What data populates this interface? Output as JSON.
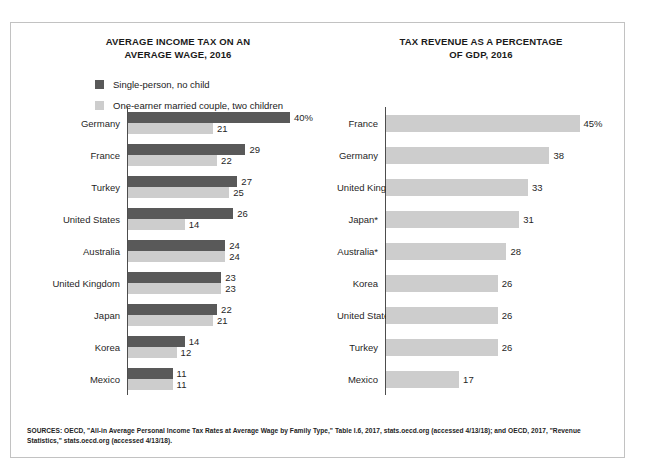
{
  "chart_data": [
    {
      "type": "bar",
      "orientation": "horizontal",
      "title": "AVERAGE INCOME TAX ON AN AVERAGE WAGE, 2016",
      "title_lines": [
        "AVERAGE INCOME TAX ON AN",
        "AVERAGE WAGE, 2016"
      ],
      "xlabel": "",
      "ylabel": "",
      "xlim": [
        0,
        40
      ],
      "grid": false,
      "legend_position": "top-left",
      "categories": [
        "Germany",
        "France",
        "Turkey",
        "United States",
        "Australia",
        "United Kingdom",
        "Japan",
        "Korea",
        "Mexico"
      ],
      "series": [
        {
          "name": "Single-person, no child",
          "color": "#595959",
          "values": [
            40,
            29,
            27,
            26,
            24,
            23,
            22,
            14,
            11
          ],
          "labels": [
            "40%",
            "29",
            "27",
            "26",
            "24",
            "23",
            "22",
            "14",
            "11"
          ]
        },
        {
          "name": "One-earner married couple, two children",
          "color": "#cdcdcd",
          "values": [
            21,
            22,
            25,
            14,
            24,
            23,
            21,
            12,
            11
          ],
          "labels": [
            "21",
            "22",
            "25",
            "14",
            "24",
            "23",
            "21",
            "12",
            "11"
          ]
        }
      ]
    },
    {
      "type": "bar",
      "orientation": "horizontal",
      "title": "TAX REVENUE AS A PERCENTAGE OF GDP, 2016",
      "title_lines": [
        "TAX REVENUE AS A PERCENTAGE",
        "OF GDP, 2016"
      ],
      "xlabel": "",
      "ylabel": "",
      "xlim": [
        0,
        45
      ],
      "grid": false,
      "legend_position": "none",
      "categories": [
        "France",
        "Germany",
        "United Kingdom",
        "Japan*",
        "Australia*",
        "Korea",
        "United States",
        "Turkey",
        "Mexico"
      ],
      "series": [
        {
          "name": "Tax revenue as a percentage of GDP",
          "color": "#cdcdcd",
          "values": [
            45,
            38,
            33,
            31,
            28,
            26,
            26,
            26,
            17
          ],
          "labels": [
            "45%",
            "38",
            "33",
            "31",
            "28",
            "26",
            "26",
            "26",
            "17"
          ]
        }
      ]
    }
  ],
  "sources": {
    "text": "SOURCES: OECD, \"All-in Average Personal Income Tax Rates at Average Wage by Family Type,\" Table I.6, 2017, stats.oecd.org (accessed 4/13/18); and OECD, 2017, \"Revenue Statistics,\" stats.oecd.org (accessed 4/13/18)."
  }
}
